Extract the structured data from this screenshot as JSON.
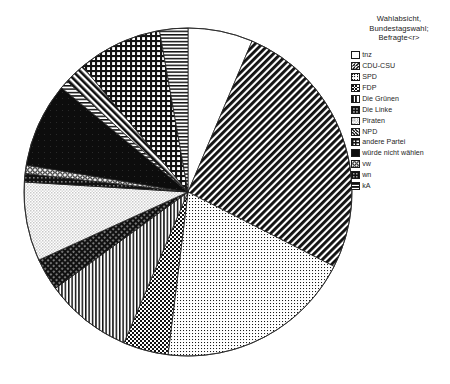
{
  "legend": {
    "title": "Wahlabsicht,\nBundestagswahl;\nBefragte<r>",
    "items": [
      {
        "label": "tnz",
        "pattern": "blank"
      },
      {
        "label": "CDU-CSU",
        "pattern": "diagonal-hatch-dense"
      },
      {
        "label": "SPD",
        "pattern": "fine-dots"
      },
      {
        "label": "FDP",
        "pattern": "checkerboard"
      },
      {
        "label": "Die Grünen",
        "pattern": "vertical-lines"
      },
      {
        "label": "Die Linke",
        "pattern": "dark-cross-hatch"
      },
      {
        "label": "Piraten",
        "pattern": "light-dots"
      },
      {
        "label": "NPD",
        "pattern": "diagonal-hatch-wide"
      },
      {
        "label": "andere Partei",
        "pattern": "grid"
      },
      {
        "label": "würde nicht wählen",
        "pattern": "solid-black"
      },
      {
        "label": "vw",
        "pattern": "circles"
      },
      {
        "label": "wn",
        "pattern": "dark-grid"
      },
      {
        "label": "kA",
        "pattern": "horizontal-lines"
      }
    ]
  },
  "chart_data": {
    "type": "pie",
    "title": "Wahlabsicht, Bundestagswahl; Befragte<r>",
    "xlabel": "",
    "ylabel": "",
    "start_angle_deg": 0,
    "direction": "clockwise",
    "units": "percent",
    "categories": [
      "tnz",
      "CDU-CSU",
      "SPD",
      "FDP",
      "Die Grünen",
      "Die Linke",
      "Piraten",
      "NPD",
      "andere Partei",
      "würde nicht wählen",
      "vw",
      "wn",
      "kA"
    ],
    "values": [
      6.4,
      26.1,
      19.4,
      4.4,
      8.6,
      3.2,
      7.8,
      2.1,
      11.1,
      8.4,
      0.9,
      0.8,
      0.8
    ],
    "slices": [
      {
        "label": "tnz",
        "value": 6.4,
        "start_deg": 0.0,
        "end_deg": 23.0,
        "pattern": "blank"
      },
      {
        "label": "CDU-CSU",
        "value": 26.1,
        "start_deg": 23.0,
        "end_deg": 117.0,
        "pattern": "diagonal-hatch-dense"
      },
      {
        "label": "SPD",
        "value": 19.4,
        "start_deg": 117.0,
        "end_deg": 187.0,
        "pattern": "fine-dots"
      },
      {
        "label": "FDP",
        "value": 4.4,
        "start_deg": 187.0,
        "end_deg": 203.0,
        "pattern": "checkerboard"
      },
      {
        "label": "Die Grünen",
        "value": 8.6,
        "start_deg": 203.0,
        "end_deg": 234.0,
        "pattern": "vertical-lines"
      },
      {
        "label": "Die Linke",
        "value": 3.2,
        "start_deg": 234.0,
        "end_deg": 245.5,
        "pattern": "dark-cross-hatch"
      },
      {
        "label": "Piraten",
        "value": 7.8,
        "start_deg": 245.5,
        "end_deg": 273.5,
        "pattern": "light-dots"
      },
      {
        "label": "wn",
        "value": 0.8,
        "start_deg": 273.5,
        "end_deg": 276.5,
        "pattern": "dark-grid"
      },
      {
        "label": "vw",
        "value": 0.9,
        "start_deg": 276.5,
        "end_deg": 279.5,
        "pattern": "circles"
      },
      {
        "label": "würde nicht wählen",
        "value": 8.4,
        "start_deg": 279.5,
        "end_deg": 309.5,
        "pattern": "solid-black"
      },
      {
        "label": "kA",
        "value": 0.8,
        "start_deg": 309.5,
        "end_deg": 312.5,
        "pattern": "horizontal-lines"
      },
      {
        "label": "NPD",
        "value": 2.1,
        "start_deg": 312.5,
        "end_deg": 320.0,
        "pattern": "diagonal-hatch-wide"
      },
      {
        "label": "andere Partei",
        "value": 11.1,
        "start_deg": 320.0,
        "end_deg": 350.0,
        "pattern": "grid"
      },
      {
        "label": "kA",
        "value": 0.8,
        "start_deg": 350.0,
        "end_deg": 360.0,
        "pattern": "horizontal-lines"
      }
    ],
    "geometry": {
      "cx": 188,
      "cy": 192,
      "r": 164
    },
    "legend_position": "right",
    "grid": false
  }
}
